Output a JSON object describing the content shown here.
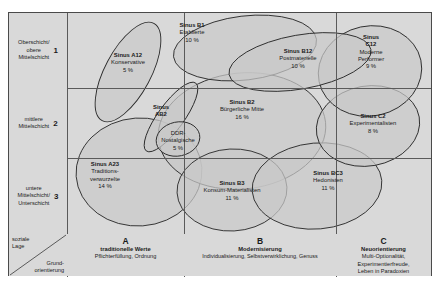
{
  "diagram": {
    "type": "bubble-positioning-map"
  },
  "axes": {
    "y_corner_label": "soziale Lage",
    "x_corner_label": "Grundorientierung",
    "rows": [
      {
        "num": "1",
        "label_lines": [
          "Oberschicht/",
          "obere",
          "Mittelschicht"
        ]
      },
      {
        "num": "2",
        "label_lines": [
          "mittlere",
          "Mittelschicht"
        ]
      },
      {
        "num": "3",
        "label_lines": [
          "untere",
          "Mittelschicht/",
          "Unterschicht"
        ]
      }
    ],
    "columns": [
      {
        "letter": "A",
        "heading": "traditionelle Werte",
        "detail_lines": [
          "Pflichterfüllung, Ordnung"
        ]
      },
      {
        "letter": "B",
        "heading": "Modernisierung",
        "detail_lines": [
          "Individualisierung, Selbstverwirklichung, Genuss"
        ]
      },
      {
        "letter": "C",
        "heading": "Neuorientierung",
        "detail_lines": [
          "Multi-Optionalität,",
          "Experimentierfreude,",
          "Leben in Paradoxien"
        ]
      }
    ]
  },
  "milieus": [
    {
      "code": "Sinus A12",
      "name": "Konservative",
      "share": "5 %"
    },
    {
      "code": "Sinus B1",
      "name": "Etablierte",
      "share": "10 %"
    },
    {
      "code": "Sinus B12",
      "name": "Postmaterielle",
      "share": "10 %"
    },
    {
      "code": "Sinus",
      "code2": "C12",
      "name": "Moderne",
      "name2": "Performer",
      "share": "9 %"
    },
    {
      "code": "Sinus",
      "code2": "AB2",
      "name": "DDR-",
      "name2": "Nostalgische",
      "share": "5 %"
    },
    {
      "code": "Sinus B2",
      "name": "Bürgerliche Mitte",
      "share": "16 %"
    },
    {
      "code": "Sinus C2",
      "name": "Experimentalisten",
      "share": "8 %"
    },
    {
      "code": "Sinus A23",
      "name": "Traditions-",
      "name2": "verwurzelte",
      "share": "14 %"
    },
    {
      "code": "Sinus B3",
      "name": "Konsum-Materialisten",
      "share": "11 %"
    },
    {
      "code": "Sinus BC3",
      "name": "Hedonisten",
      "share": "11 %"
    }
  ],
  "colors": {
    "cell_background": "#d9d9d9",
    "bubble_fill": "#c9c9c9",
    "bubble_stroke": "#2a2a2a",
    "grid_line": "#5a5a5a",
    "frame": "#4a4a4a",
    "text": "#1a1a1a"
  }
}
